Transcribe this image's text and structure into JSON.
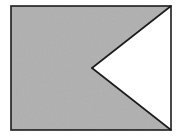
{
  "canvas": {
    "width": 183,
    "height": 139,
    "background_color": "#ffffff"
  },
  "figure": {
    "name": "swallowtail-notched-rectangle",
    "fill_color": "#b0b0b0",
    "notch_fill_color": "#ffffff",
    "stroke_color": "#1c1c1c",
    "stroke_width": 1.6,
    "rectangle": {
      "left": 11,
      "top": 6,
      "right": 171,
      "bottom": 130,
      "width": 160,
      "height": 124
    },
    "notch": {
      "apex_x": 92,
      "apex_y": 68,
      "top_x": 171,
      "top_y": 6,
      "bottom_x": 171,
      "bottom_y": 130,
      "depth": 79,
      "opening_height": 124
    },
    "gray_polygon_points": "11,6 171,6 92,68 171,130 11,130",
    "notch_polygon_points": "171,6 92,68 171,130",
    "texture": {
      "enabled": true,
      "speckle_color": "#a8a8a8",
      "highlight_color": "#b9b9b9",
      "opacity": 0.55
    }
  }
}
